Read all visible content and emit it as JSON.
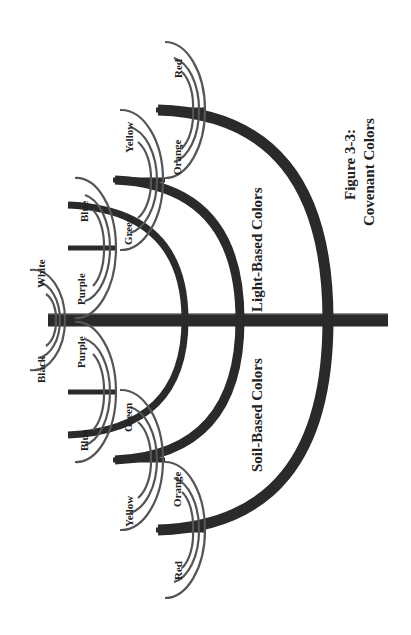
{
  "figure": {
    "caption_line1": "Figure 3-3:",
    "caption_line2": "Covenant Colors"
  },
  "groups": {
    "light": {
      "label": "Light-Based Colors"
    },
    "soil": {
      "label": "Soil-Based Colors"
    }
  },
  "light_branches": [
    {
      "outer": "White",
      "inner": "Purple"
    },
    {
      "outer": "Blue",
      "inner": "Green"
    },
    {
      "outer": "Yellow",
      "inner": "Orange"
    },
    {
      "outer": "Red",
      "inner": ""
    }
  ],
  "soil_branches": [
    {
      "outer": "Black",
      "inner": "Purple"
    },
    {
      "outer": "Blue",
      "inner": "Green"
    },
    {
      "outer": "Yellow",
      "inner": "Orange"
    },
    {
      "outer": "Red",
      "inner": ""
    }
  ],
  "labels": {
    "light_white": "White",
    "light_purple": "Purple",
    "light_blue": "Blue",
    "light_green": "Green",
    "light_yellow": "Yellow",
    "light_orange": "Orange",
    "light_red": "Red",
    "soil_black": "Black",
    "soil_purple": "Purple",
    "soil_blue": "Blue",
    "soil_green": "Green",
    "soil_yellow": "Yellow",
    "soil_orange": "Orange",
    "soil_red": "Red"
  },
  "colors": {
    "stroke_dark": "#2a2a2a",
    "stroke_mid": "#555555",
    "background": "#ffffff"
  }
}
